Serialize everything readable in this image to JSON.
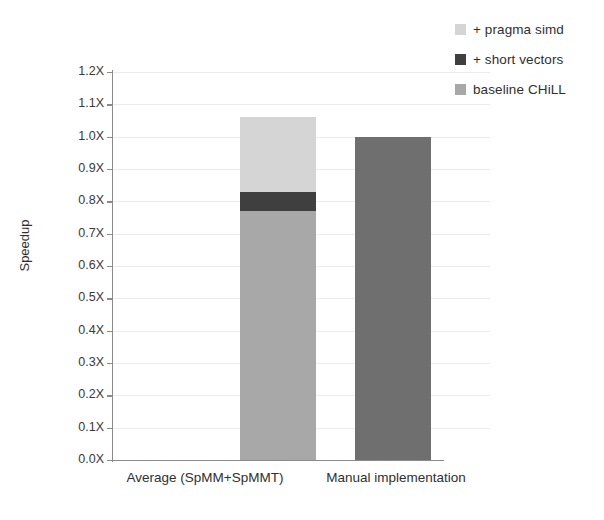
{
  "chart_data": {
    "type": "bar",
    "subtype": "stacked-bar",
    "title": "",
    "xlabel": "",
    "ylabel": "Speedup",
    "ylim": [
      0.0,
      1.2
    ],
    "ytick_step": 0.1,
    "grid": true,
    "legend_position": "top-right",
    "categories": [
      "Average (SpMM+SpMMT)",
      "Manual implementation"
    ],
    "ytick_labels": [
      "1.2X",
      "1.1X",
      "1.0X",
      "0.9X",
      "0.8X",
      "0.7X",
      "0.6X",
      "0.5X",
      "0.4X",
      "0.3X",
      "0.2X",
      "0.1X",
      "0.0X"
    ],
    "ytick_values": [
      1.2,
      1.1,
      1.0,
      0.9,
      0.8,
      0.7,
      0.6,
      0.5,
      0.4,
      0.3,
      0.2,
      0.1,
      0.0
    ],
    "series": [
      {
        "name": "baseline CHiLL",
        "color": "#a8a8a8",
        "values": [
          0.77,
          1.0
        ]
      },
      {
        "name": "+ short vectors",
        "color": "#3f3f3f",
        "values": [
          0.06,
          0.0
        ]
      },
      {
        "name": "+ pragma simd",
        "color": "#d5d5d5",
        "values": [
          0.23,
          0.0
        ]
      }
    ],
    "cumulative_tops": [
      {
        "category": "Average (SpMM+SpMMT)",
        "baseline_CHiLL": 0.77,
        "plus_short_vectors": 0.83,
        "plus_pragma_simd": 1.06
      },
      {
        "category": "Manual implementation",
        "baseline_CHiLL": 1.0,
        "plus_short_vectors": 1.0,
        "plus_pragma_simd": 1.0
      }
    ],
    "bar_colors_by_category": {
      "Average (SpMM+SpMMT)": "#a8a8a8",
      "Manual implementation": "#6f6f6f"
    }
  },
  "legend": {
    "items": [
      {
        "label": "+ pragma simd",
        "color": "#d5d5d5"
      },
      {
        "label": "+ short vectors",
        "color": "#3f3f3f"
      },
      {
        "label": "baseline CHiLL",
        "color": "#a8a8a8"
      }
    ]
  },
  "axes": {
    "y_title": "Speedup",
    "y_labels": [
      "1.2X",
      "1.1X",
      "1.0X",
      "0.9X",
      "0.8X",
      "0.7X",
      "0.6X",
      "0.5X",
      "0.4X",
      "0.3X",
      "0.2X",
      "0.1X",
      "0.0X"
    ],
    "x_labels": [
      "Average (SpMM+SpMMT)",
      "Manual implementation"
    ]
  },
  "colors": {
    "axis": "#8a8a8a",
    "grid": "#ececec",
    "text": "#2f2f2f",
    "light_gray": "#d5d5d5",
    "dark_gray": "#3f3f3f",
    "mid_gray": "#a8a8a8",
    "manual_gray": "#6f6f6f"
  }
}
